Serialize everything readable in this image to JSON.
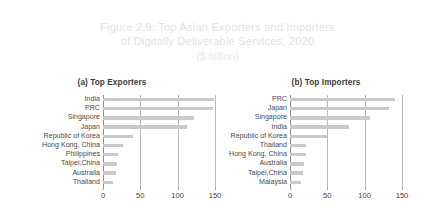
{
  "figure": {
    "title_line_1": "Figure 2.9: Top Asian Exporters and Importers",
    "title_line_2": "of Digitally Deliverable Services, 2020",
    "subtitle": "($ billion)",
    "title_color": "#e2e2e4",
    "bar_color": "#c9c9cb",
    "grid_color": "#b9b9bb",
    "text_color": "#4a4a4a",
    "background": "#ffffff"
  },
  "chart_data": [
    {
      "type": "bar",
      "orientation": "horizontal",
      "title": "(a) Top Exporters",
      "panel_label": "a",
      "categories": [
        "India",
        "PRC",
        "Singapore",
        "Japan",
        "Republic of Korea",
        "Hong Kong, China",
        "Philippines",
        "Taipei,China",
        "Australia",
        "Thailand"
      ],
      "values": [
        148,
        147,
        122,
        113,
        40,
        27,
        20,
        19,
        17,
        14
      ],
      "xlabel": "",
      "ylabel": "",
      "xlim": [
        0,
        150
      ],
      "xticks": [
        0,
        50,
        100,
        150
      ],
      "xtick_labels": [
        "0",
        "50",
        "100",
        "150"
      ],
      "grid": true,
      "legend": false
    },
    {
      "type": "bar",
      "orientation": "horizontal",
      "title": "(b) Top Importers",
      "panel_label": "b",
      "categories": [
        "PRC",
        "Japan",
        "Singapore",
        "India",
        "Republic of Korea",
        "Thailand",
        "Hong Kong, China",
        "Australia",
        "Taipei,China",
        "Malaysia"
      ],
      "values": [
        140,
        133,
        107,
        79,
        49,
        22,
        21,
        19,
        18,
        15
      ],
      "xlabel": "",
      "ylabel": "",
      "xlim": [
        0,
        150
      ],
      "xticks": [
        0,
        50,
        100,
        150
      ],
      "xtick_labels": [
        "0",
        "50",
        "100",
        "150"
      ],
      "grid": true,
      "legend": false
    }
  ]
}
